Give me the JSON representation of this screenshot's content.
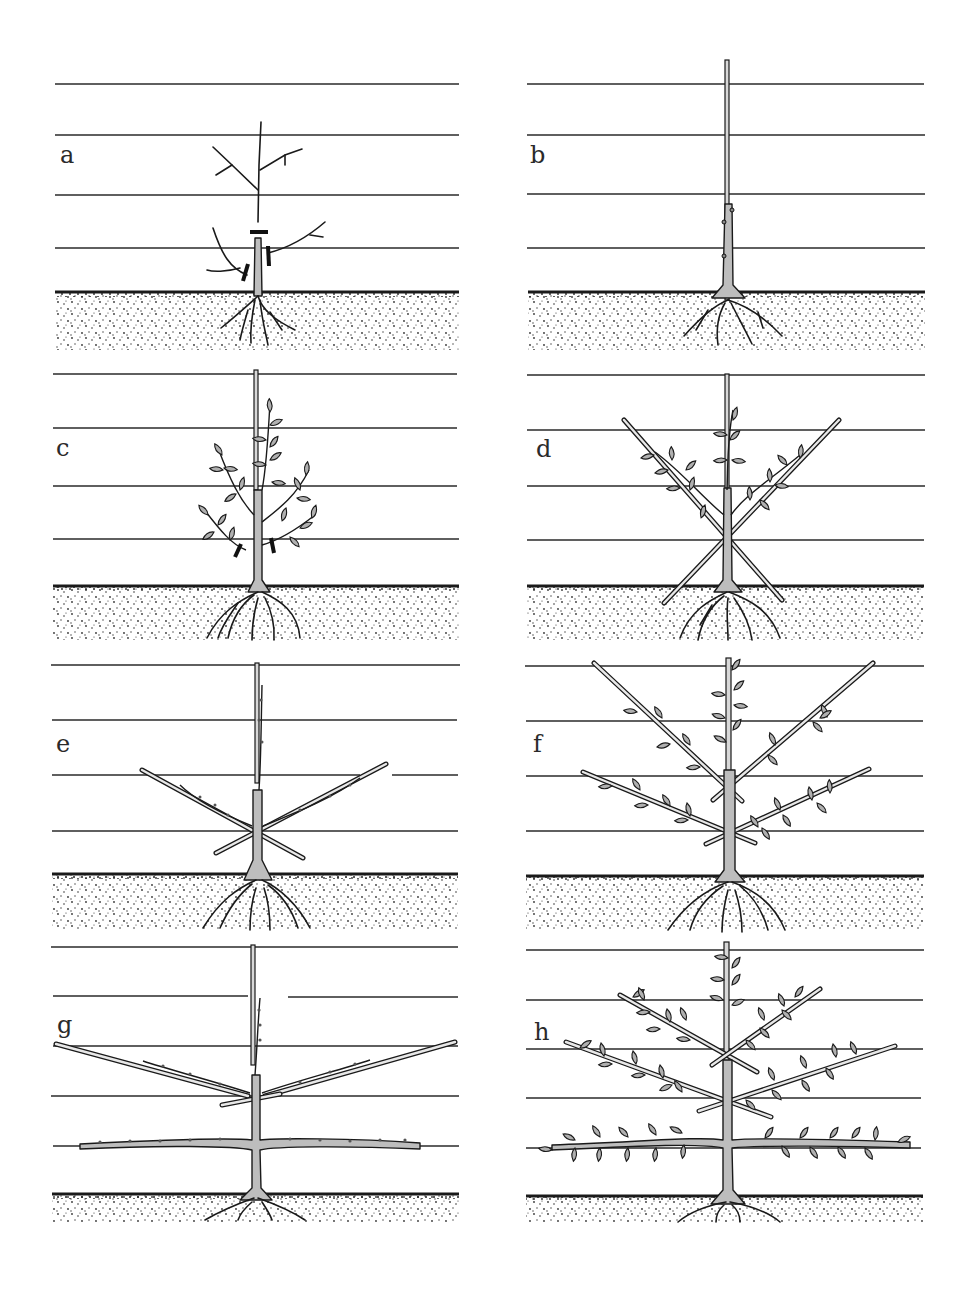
{
  "figure": {
    "panel_count": 8,
    "colors": {
      "ink": "#1a1a1a",
      "wire": "#2a2a2a",
      "trunk_fill": "#bdbdbd",
      "leaf_fill": "#b0b0b0",
      "soil_dot": "#333333",
      "background": "#ffffff"
    }
  },
  "panels": [
    {
      "label": "a",
      "description": "Maiden tree with cut marks showing where to prune the leader and side shoots"
    },
    {
      "label": "b",
      "description": "Pruned whip tied to a vertical cane"
    },
    {
      "label": "c",
      "description": "New shoots growing in leaf; lower shoots marked for removal"
    },
    {
      "label": "d",
      "description": "Two side shoots tied in at 45° on diagonal canes"
    },
    {
      "label": "e",
      "description": "Side arms lowered on canes; leader cut back"
    },
    {
      "label": "f",
      "description": "Second tier of arms trained on diagonal canes, in leaf"
    },
    {
      "label": "g",
      "description": "Lowest tier tied horizontally along the wire; upper arms on shallow canes"
    },
    {
      "label": "h",
      "description": "Completed three-tier espalier in leaf"
    }
  ]
}
